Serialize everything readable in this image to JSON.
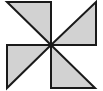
{
  "figure": {
    "name": "pinwheel",
    "canvas": {
      "width": 103,
      "height": 91,
      "background_color": "#ffffff"
    },
    "style": {
      "fill_color": "#d2d2d2",
      "stroke_color": "#1a1a1a",
      "stroke_width": 2,
      "center_x": 51,
      "center_y": 45
    },
    "squares": [
      {
        "name": "top-left-square",
        "left": 7,
        "top": 2,
        "right": 51,
        "bottom": 45
      },
      {
        "name": "top-right-square",
        "left": 51,
        "top": 2,
        "right": 96,
        "bottom": 45
      },
      {
        "name": "bottom-left-square",
        "left": 7,
        "top": 45,
        "right": 51,
        "bottom": 88
      },
      {
        "name": "bottom-right-square",
        "left": 51,
        "top": 45,
        "right": 95,
        "bottom": 88
      }
    ],
    "blades": [
      {
        "name": "blade-top-left",
        "quadrant": "top-left",
        "points": "7,2 51,2 51,45",
        "diagonal": "7,2 51,45",
        "shaded": true
      },
      {
        "name": "blade-top-right",
        "quadrant": "top-right",
        "points": "96,2 96,45 51,45",
        "diagonal": "96,2 51,45",
        "shaded": true
      },
      {
        "name": "blade-bottom-left",
        "quadrant": "bottom-left",
        "points": "7,45 51,45 7,88",
        "diagonal": "51,45 7,88",
        "shaded": true
      },
      {
        "name": "blade-bottom-right",
        "quadrant": "bottom-right",
        "points": "51,45 95,88 51,88",
        "diagonal": "51,45 95,88",
        "shaded": true
      }
    ],
    "blade_count": 4
  }
}
